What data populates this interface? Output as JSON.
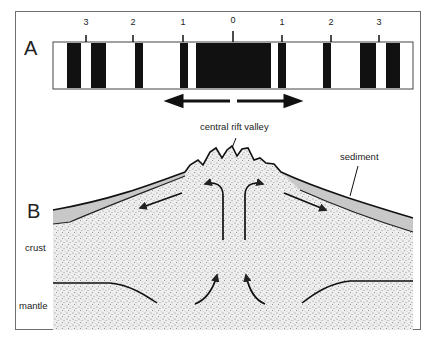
{
  "panel_a": {
    "label": "A",
    "tick_labels_left": [
      "3",
      "2",
      "1"
    ],
    "center_label": "0",
    "tick_labels_right": [
      "1",
      "2",
      "3"
    ],
    "arrow_meaning": "spreading away from ridge axis"
  },
  "panel_b": {
    "label": "B",
    "annotations": {
      "rift": "central rift valley",
      "sediment": "sediment",
      "crust": "crust",
      "mantle": "mantle"
    }
  },
  "caption": ""
}
